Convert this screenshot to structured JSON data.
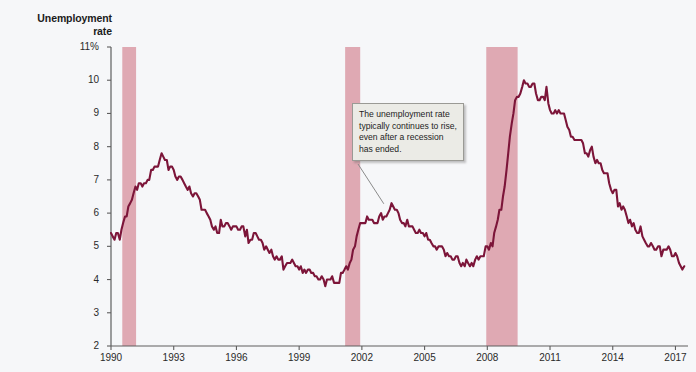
{
  "chart_data": {
    "type": "line",
    "title": "Unemployment\nrate",
    "xlabel": "",
    "ylabel": "Unemployment rate",
    "ylim": [
      2,
      11
    ],
    "xlim": [
      1990,
      2017.6
    ],
    "grid": false,
    "legend": "none",
    "y_tick_labels": [
      "11%",
      "10",
      "9",
      "8",
      "7",
      "6",
      "5",
      "4",
      "3",
      "2"
    ],
    "y_ticks": [
      11,
      10,
      9,
      8,
      7,
      6,
      5,
      4,
      3,
      2
    ],
    "x_ticks": [
      1990,
      1993,
      1996,
      1999,
      2002,
      2005,
      2008,
      2011,
      2014,
      2017
    ],
    "x_tick_labels": [
      "1990",
      "1993",
      "1996",
      "1999",
      "2002",
      "2005",
      "2008",
      "2011",
      "2014",
      "2017"
    ],
    "line_color": "#7c1539",
    "recession_band_color": "#dfa9b3",
    "background_color": "#f6f7f9",
    "annotation": {
      "text": "The unemployment rate typically continues to rise, even after a recession has ended.",
      "points_to_x": 2003.05,
      "points_to_y": 6.28
    },
    "recessions": [
      {
        "start": 1990.54,
        "end": 1991.2,
        "label": "1990-91 recession"
      },
      {
        "start": 2001.2,
        "end": 2001.92,
        "label": "2001 recession"
      },
      {
        "start": 2007.95,
        "end": 2009.45,
        "label": "2008-09 Great Recession"
      }
    ],
    "series": [
      {
        "name": "Unemployment rate",
        "units": "percent",
        "x": [
          1990.0,
          1990.08,
          1990.17,
          1990.25,
          1990.33,
          1990.42,
          1990.5,
          1990.58,
          1990.67,
          1990.75,
          1990.83,
          1990.92,
          1991.0,
          1991.08,
          1991.17,
          1991.25,
          1991.33,
          1991.42,
          1991.5,
          1991.58,
          1991.67,
          1991.75,
          1991.83,
          1991.92,
          1992.0,
          1992.08,
          1992.17,
          1992.25,
          1992.33,
          1992.42,
          1992.5,
          1992.58,
          1992.67,
          1992.75,
          1992.83,
          1992.92,
          1993.0,
          1993.08,
          1993.17,
          1993.25,
          1993.33,
          1993.42,
          1993.5,
          1993.58,
          1993.67,
          1993.75,
          1993.83,
          1993.92,
          1994.0,
          1994.08,
          1994.17,
          1994.25,
          1994.33,
          1994.42,
          1994.5,
          1994.58,
          1994.67,
          1994.75,
          1994.83,
          1994.92,
          1995.0,
          1995.08,
          1995.17,
          1995.25,
          1995.33,
          1995.42,
          1995.5,
          1995.58,
          1995.67,
          1995.75,
          1995.83,
          1995.92,
          1996.0,
          1996.08,
          1996.17,
          1996.25,
          1996.33,
          1996.42,
          1996.5,
          1996.58,
          1996.67,
          1996.75,
          1996.83,
          1996.92,
          1997.0,
          1997.08,
          1997.17,
          1997.25,
          1997.33,
          1997.42,
          1997.5,
          1997.58,
          1997.67,
          1997.75,
          1997.83,
          1997.92,
          1998.0,
          1998.08,
          1998.17,
          1998.25,
          1998.33,
          1998.42,
          1998.5,
          1998.58,
          1998.67,
          1998.75,
          1998.83,
          1998.92,
          1999.0,
          1999.08,
          1999.17,
          1999.25,
          1999.33,
          1999.42,
          1999.5,
          1999.58,
          1999.67,
          1999.75,
          1999.83,
          1999.92,
          2000.0,
          2000.08,
          2000.17,
          2000.25,
          2000.33,
          2000.42,
          2000.5,
          2000.58,
          2000.67,
          2000.75,
          2000.83,
          2000.92,
          2001.0,
          2001.08,
          2001.17,
          2001.25,
          2001.33,
          2001.42,
          2001.5,
          2001.58,
          2001.67,
          2001.75,
          2001.83,
          2001.92,
          2002.0,
          2002.08,
          2002.17,
          2002.25,
          2002.33,
          2002.42,
          2002.5,
          2002.58,
          2002.67,
          2002.75,
          2002.83,
          2002.92,
          2003.0,
          2003.08,
          2003.17,
          2003.25,
          2003.33,
          2003.42,
          2003.5,
          2003.58,
          2003.67,
          2003.75,
          2003.83,
          2003.92,
          2004.0,
          2004.08,
          2004.17,
          2004.25,
          2004.33,
          2004.42,
          2004.5,
          2004.58,
          2004.67,
          2004.75,
          2004.83,
          2004.92,
          2005.0,
          2005.08,
          2005.17,
          2005.25,
          2005.33,
          2005.42,
          2005.5,
          2005.58,
          2005.67,
          2005.75,
          2005.83,
          2005.92,
          2006.0,
          2006.08,
          2006.17,
          2006.25,
          2006.33,
          2006.42,
          2006.5,
          2006.58,
          2006.67,
          2006.75,
          2006.83,
          2006.92,
          2007.0,
          2007.08,
          2007.17,
          2007.25,
          2007.33,
          2007.42,
          2007.5,
          2007.58,
          2007.67,
          2007.75,
          2007.83,
          2007.92,
          2008.0,
          2008.08,
          2008.17,
          2008.25,
          2008.33,
          2008.42,
          2008.5,
          2008.58,
          2008.67,
          2008.75,
          2008.83,
          2008.92,
          2009.0,
          2009.08,
          2009.17,
          2009.25,
          2009.33,
          2009.42,
          2009.5,
          2009.58,
          2009.67,
          2009.75,
          2009.83,
          2009.92,
          2010.0,
          2010.08,
          2010.17,
          2010.25,
          2010.33,
          2010.42,
          2010.5,
          2010.58,
          2010.67,
          2010.75,
          2010.83,
          2010.92,
          2011.0,
          2011.08,
          2011.17,
          2011.25,
          2011.33,
          2011.42,
          2011.5,
          2011.58,
          2011.67,
          2011.75,
          2011.83,
          2011.92,
          2012.0,
          2012.08,
          2012.17,
          2012.25,
          2012.33,
          2012.42,
          2012.5,
          2012.58,
          2012.67,
          2012.75,
          2012.83,
          2012.92,
          2013.0,
          2013.08,
          2013.17,
          2013.25,
          2013.33,
          2013.42,
          2013.5,
          2013.58,
          2013.67,
          2013.75,
          2013.83,
          2013.92,
          2014.0,
          2014.08,
          2014.17,
          2014.25,
          2014.33,
          2014.42,
          2014.5,
          2014.58,
          2014.67,
          2014.75,
          2014.83,
          2014.92,
          2015.0,
          2015.08,
          2015.17,
          2015.25,
          2015.33,
          2015.42,
          2015.5,
          2015.58,
          2015.67,
          2015.75,
          2015.83,
          2015.92,
          2016.0,
          2016.08,
          2016.17,
          2016.25,
          2016.33,
          2016.42,
          2016.5,
          2016.58,
          2016.67,
          2016.75,
          2016.83,
          2016.92,
          2017.0,
          2017.08,
          2017.17,
          2017.25,
          2017.33,
          2017.42
        ],
        "values": [
          5.4,
          5.3,
          5.2,
          5.4,
          5.4,
          5.2,
          5.5,
          5.7,
          5.9,
          5.9,
          6.2,
          6.3,
          6.4,
          6.6,
          6.8,
          6.7,
          6.9,
          6.9,
          6.8,
          6.9,
          6.9,
          7.0,
          7.0,
          7.3,
          7.3,
          7.4,
          7.4,
          7.4,
          7.6,
          7.8,
          7.7,
          7.6,
          7.6,
          7.3,
          7.4,
          7.4,
          7.3,
          7.1,
          7.0,
          7.1,
          7.1,
          7.0,
          6.9,
          6.8,
          6.7,
          6.8,
          6.6,
          6.5,
          6.6,
          6.6,
          6.5,
          6.4,
          6.1,
          6.1,
          6.1,
          6.0,
          5.9,
          5.8,
          5.6,
          5.5,
          5.6,
          5.4,
          5.4,
          5.8,
          5.6,
          5.6,
          5.7,
          5.7,
          5.6,
          5.5,
          5.6,
          5.6,
          5.6,
          5.5,
          5.5,
          5.6,
          5.6,
          5.3,
          5.5,
          5.1,
          5.2,
          5.2,
          5.4,
          5.4,
          5.3,
          5.2,
          5.2,
          5.1,
          4.9,
          5.0,
          4.9,
          4.8,
          4.9,
          4.7,
          4.6,
          4.7,
          4.6,
          4.6,
          4.7,
          4.3,
          4.4,
          4.5,
          4.5,
          4.5,
          4.6,
          4.5,
          4.4,
          4.4,
          4.3,
          4.4,
          4.2,
          4.3,
          4.2,
          4.3,
          4.3,
          4.2,
          4.2,
          4.1,
          4.1,
          4.0,
          4.0,
          4.1,
          4.0,
          3.8,
          4.0,
          4.0,
          4.0,
          4.1,
          3.9,
          3.9,
          3.9,
          3.9,
          4.2,
          4.2,
          4.3,
          4.4,
          4.3,
          4.5,
          4.6,
          4.9,
          5.0,
          5.3,
          5.5,
          5.7,
          5.7,
          5.7,
          5.7,
          5.9,
          5.8,
          5.8,
          5.8,
          5.7,
          5.7,
          5.7,
          5.9,
          6.0,
          5.8,
          5.9,
          5.9,
          6.0,
          6.1,
          6.3,
          6.2,
          6.1,
          6.1,
          6.0,
          5.8,
          5.7,
          5.7,
          5.6,
          5.8,
          5.6,
          5.6,
          5.6,
          5.5,
          5.4,
          5.4,
          5.5,
          5.4,
          5.4,
          5.3,
          5.4,
          5.2,
          5.2,
          5.1,
          5.0,
          5.0,
          4.9,
          5.0,
          5.0,
          5.0,
          4.9,
          4.7,
          4.8,
          4.7,
          4.7,
          4.6,
          4.6,
          4.7,
          4.7,
          4.5,
          4.4,
          4.5,
          4.4,
          4.6,
          4.5,
          4.4,
          4.5,
          4.4,
          4.6,
          4.7,
          4.6,
          4.7,
          4.7,
          4.7,
          5.0,
          5.0,
          4.9,
          5.1,
          5.0,
          5.4,
          5.6,
          5.8,
          6.1,
          6.1,
          6.5,
          6.8,
          7.3,
          7.8,
          8.3,
          8.7,
          9.0,
          9.4,
          9.5,
          9.5,
          9.6,
          9.8,
          10.0,
          9.9,
          9.9,
          9.8,
          9.8,
          9.9,
          9.9,
          9.6,
          9.4,
          9.4,
          9.5,
          9.5,
          9.4,
          9.8,
          9.3,
          9.1,
          9.0,
          9.0,
          9.1,
          9.0,
          9.1,
          9.0,
          9.0,
          9.0,
          8.8,
          8.6,
          8.5,
          8.3,
          8.3,
          8.2,
          8.2,
          8.2,
          8.2,
          8.2,
          8.1,
          7.8,
          7.8,
          7.7,
          7.9,
          8.0,
          7.7,
          7.5,
          7.6,
          7.5,
          7.5,
          7.3,
          7.2,
          7.2,
          7.2,
          6.9,
          6.7,
          6.6,
          6.7,
          6.7,
          6.2,
          6.3,
          6.1,
          6.2,
          6.1,
          5.9,
          5.7,
          5.8,
          5.6,
          5.7,
          5.5,
          5.4,
          5.4,
          5.6,
          5.3,
          5.2,
          5.1,
          5.0,
          5.0,
          5.1,
          5.0,
          4.9,
          4.9,
          5.0,
          5.0,
          4.7,
          4.9,
          4.9,
          4.9,
          5.0,
          4.9,
          4.7,
          4.7,
          4.8,
          4.7,
          4.5,
          4.4,
          4.3,
          4.4
        ]
      }
    ]
  },
  "annotation_ui": {
    "text": "The unemployment rate typically continues to rise, even after a recession has ended."
  }
}
